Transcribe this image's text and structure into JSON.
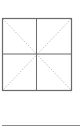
{
  "icon": {
    "name": "table-grid-with-diagonals",
    "frame_color": "#6b6b6b",
    "diagonal_color": "#b8b8b8",
    "underline_color": "#8a8a8a"
  }
}
